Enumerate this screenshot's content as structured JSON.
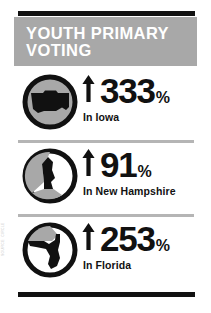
{
  "header": {
    "title": "YOUTH PRIMARY VOTING"
  },
  "rows": [
    {
      "icon_name": "iowa-map-icon",
      "arrow_name": "up-arrow-icon",
      "value": "333",
      "percent": "%",
      "caption": "In Iowa"
    },
    {
      "icon_name": "new-hampshire-map-icon",
      "arrow_name": "up-arrow-icon",
      "value": "91",
      "percent": "%",
      "caption": "In New Hampshire"
    },
    {
      "icon_name": "florida-map-icon",
      "arrow_name": "up-arrow-icon",
      "value": "253",
      "percent": "%",
      "caption": "In Florida"
    }
  ],
  "source_credit": "SOURCE: CIRCLE",
  "colors": {
    "header_background": "#a8a8a8",
    "header_text": "#ffffff",
    "bar": "#111111",
    "separator": "#b5b5b5",
    "icon_fill": "#a8a8a8",
    "icon_outline": "#111111",
    "page_background": "#ffffff",
    "value_text": "#111111"
  }
}
